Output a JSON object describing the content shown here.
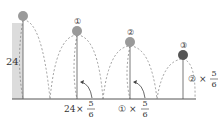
{
  "diagram": {
    "initial_height_label": "24",
    "balls": [
      {
        "id": "0",
        "label": "",
        "color": "#9a9a9a"
      },
      {
        "id": "1",
        "label": "①",
        "color": "#9a9a9a"
      },
      {
        "id": "2",
        "label": "②",
        "color": "#9a9a9a"
      },
      {
        "id": "3",
        "label": "③",
        "color": "#555555"
      }
    ],
    "rebound_labels": [
      {
        "base": "24",
        "times": "×",
        "numerator": "5",
        "denominator": "6"
      },
      {
        "base": "①",
        "times": "×",
        "numerator": "5",
        "denominator": "6"
      },
      {
        "base": "②",
        "times": "×",
        "numerator": "5",
        "denominator": "6"
      }
    ],
    "colors": {
      "column_fill": "#dcdcdc",
      "line": "#555555",
      "dashed": "#777777"
    }
  }
}
